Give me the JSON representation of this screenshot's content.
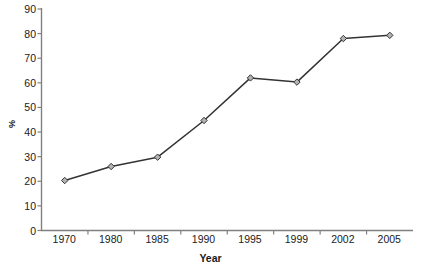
{
  "chart_data": {
    "type": "line",
    "title": "",
    "subtitle": "",
    "xlabel": "Year",
    "ylabel": "%",
    "categories": [
      "1970",
      "1980",
      "1985",
      "1990",
      "1995",
      "1999",
      "2002",
      "2005"
    ],
    "values": [
      20.3,
      26.0,
      29.8,
      44.7,
      62.0,
      60.3,
      78.0,
      79.3
    ],
    "series": [
      {
        "name": "",
        "values": [
          20.3,
          26.0,
          29.8,
          44.7,
          62.0,
          60.3,
          78.0,
          79.3
        ]
      }
    ],
    "ylim": [
      0,
      90
    ],
    "ytick_values": [
      0,
      10,
      20,
      30,
      40,
      50,
      60,
      70,
      80,
      90
    ],
    "ytick_labels": [
      "0",
      "10",
      "20",
      "30",
      "40",
      "50",
      "60",
      "70",
      "80",
      "90"
    ],
    "grid": false,
    "legend": false,
    "legend_position": "none",
    "marker": "diamond",
    "line_color": "#333333",
    "marker_fill": "#b3b3b3",
    "marker_edge": "#333333",
    "axis_color": "#808080",
    "text_color": "#1a1a1a",
    "annotations": []
  }
}
